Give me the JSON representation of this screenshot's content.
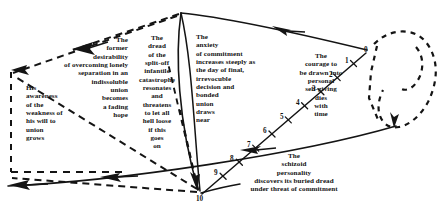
{
  "figure": {
    "background_color": "#ffffff",
    "ink_color": "#141414",
    "width": 444,
    "height": 211
  },
  "labels": {
    "former_desirability": "The\nformer\ndesirability\nof overcoming lonely\nseparation in an\nindissoluble\nunion\nbecomes\na fading\nhope",
    "dread_split_off": "The\ndread\nof the\nsplit-off\ninfantile\ncatastrophe\nresonates\nand\nthreatens\nto let all\nhell loose\nif this\ngoes\non",
    "anxiety_of_commitment": "The\nanxiety\nof commitment\nincreases steeply as\n   the day of final,\nirrevocuble\ndecision and\nbonded\nunion\ndraws\nnear",
    "courage_to_be_drawn": "The\ncourage to\nbe drawn into\npersonal\nself-giving\ndies\nwith\ntime",
    "his_awareness": "His\nawareness\nof the\nweakness of\nhis will to\nunion\ngrows",
    "schizoid_personality": "The\nschizoid\npersonality\ndiscovers its buried dread\nunder threat of commitment"
  },
  "scale": {
    "name": "commitment-time-scale",
    "ticks": [
      "0",
      "1",
      "2",
      "3",
      "4",
      "5",
      "6",
      "7",
      "8",
      "9",
      "10"
    ]
  }
}
